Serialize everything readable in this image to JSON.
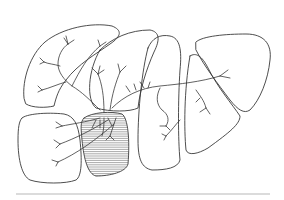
{
  "figure": {
    "kind": "anatomical line drawing",
    "corner_label": "",
    "segments": [
      {
        "id": "left-upper-lobe",
        "hatched": false
      },
      {
        "id": "left-lower-segment",
        "hatched": false
      },
      {
        "id": "hatched-segment",
        "hatched": true
      },
      {
        "id": "middle-segment-a",
        "hatched": false
      },
      {
        "id": "middle-segment-b",
        "hatched": false
      },
      {
        "id": "right-lobe",
        "hatched": false
      }
    ],
    "colors": {
      "line": "#3a3a3a",
      "baseline": "#b8b8b8",
      "background": "#ffffff"
    }
  }
}
